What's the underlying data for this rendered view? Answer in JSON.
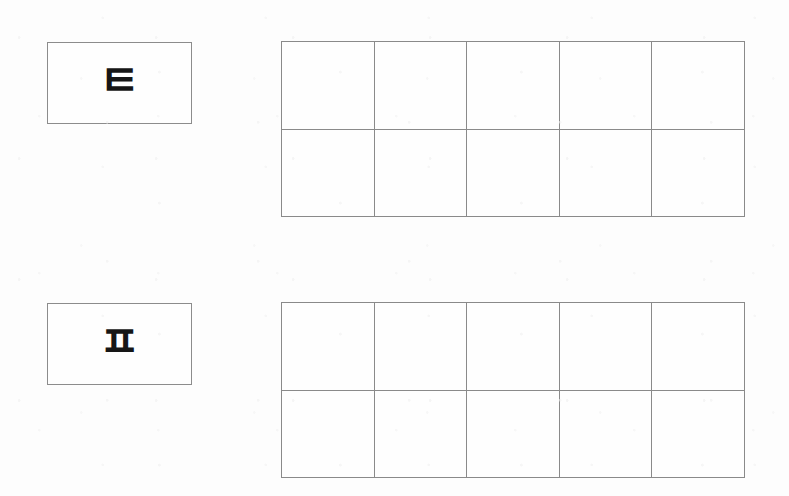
{
  "document": {
    "type": "handwriting-practice-worksheet",
    "script": "Hangul",
    "background_color": "#fdfdfd",
    "line_color": "#8a8a8a",
    "ink_color": "#161616"
  },
  "exercises": [
    {
      "id": "exercise-1",
      "model": {
        "character": "ㅌ",
        "romanization": "t",
        "name": "tieut"
      },
      "grid": {
        "columns": 5,
        "rows": 2,
        "cells": [
          "",
          "",
          "",
          "",
          "",
          "",
          "",
          "",
          "",
          ""
        ]
      }
    },
    {
      "id": "exercise-2",
      "model": {
        "character": "ㅍ",
        "romanization": "p",
        "name": "pieup"
      },
      "grid": {
        "columns": 5,
        "rows": 2,
        "cells": [
          "",
          "",
          "",
          "",
          "",
          "",
          "",
          "",
          "",
          ""
        ]
      }
    }
  ]
}
